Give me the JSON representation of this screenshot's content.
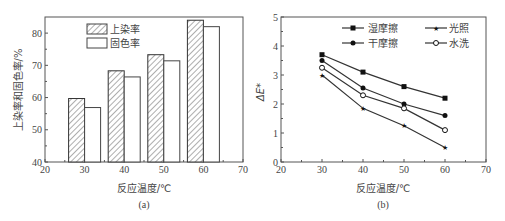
{
  "chart_data": [
    {
      "type": "bar",
      "panel": "(a)",
      "xlabel": "反应温度/℃",
      "ylabel": "上染率和固色率/%",
      "xlim": [
        20,
        70
      ],
      "ylim": [
        40,
        85
      ],
      "xticks": [
        "20",
        "30",
        "40",
        "50",
        "60",
        "70"
      ],
      "yticks": [
        "40",
        "50",
        "60",
        "70",
        "80"
      ],
      "categories": [
        "30",
        "40",
        "50",
        "60"
      ],
      "series": [
        {
          "name": "上染率",
          "pattern": "hatched",
          "values": [
            59.7,
            68.3,
            73.3,
            84.0
          ]
        },
        {
          "name": "固色率",
          "pattern": "open",
          "values": [
            56.9,
            66.4,
            71.4,
            82.0
          ]
        }
      ],
      "legend_position": "upper-left",
      "grid": false
    },
    {
      "type": "line",
      "panel": "(b)",
      "xlabel": "反应温度/℃",
      "ylabel": "ΔE*",
      "xlim": [
        20,
        70
      ],
      "ylim": [
        0,
        5
      ],
      "xticks": [
        "20",
        "30",
        "40",
        "50",
        "60",
        "70"
      ],
      "yticks": [
        "0",
        "1",
        "2",
        "3",
        "4",
        "5"
      ],
      "x": [
        30,
        40,
        50,
        60
      ],
      "series": [
        {
          "name": "湿摩擦",
          "marker": "square",
          "values": [
            3.7,
            3.1,
            2.6,
            2.2
          ]
        },
        {
          "name": "干摩擦",
          "marker": "filled-circle",
          "values": [
            3.5,
            2.55,
            2.0,
            1.6
          ]
        },
        {
          "name": "光照",
          "marker": "star",
          "values": [
            3.0,
            1.85,
            1.25,
            0.5
          ]
        },
        {
          "name": "水洗",
          "marker": "open-circle",
          "values": [
            3.25,
            2.3,
            1.85,
            1.1
          ]
        }
      ],
      "legend_position": "upper-right",
      "grid": false
    }
  ],
  "labels": {
    "a": {
      "xlabel": "反应温度/℃",
      "ylabel": "上染率和固色率/%",
      "caption": "(a)",
      "legend": [
        "上染率",
        "固色率"
      ]
    },
    "b": {
      "xlabel": "反应温度/℃",
      "ylabel": "ΔE*",
      "caption": "(b)",
      "legend": [
        "湿摩擦",
        "光照",
        "干摩擦",
        "水洗"
      ]
    }
  }
}
